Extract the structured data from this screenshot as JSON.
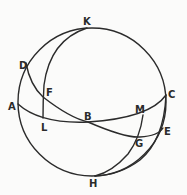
{
  "diagram": {
    "type": "spherical-geometry",
    "colors": {
      "stroke": "#2b2b2b",
      "background": "#fbfbfa"
    },
    "labels": {
      "K": "K",
      "D": "D",
      "F": "F",
      "A": "A",
      "L": "L",
      "B": "B",
      "M": "M",
      "C": "C",
      "E": "E",
      "G": "G",
      "H": "H"
    }
  }
}
